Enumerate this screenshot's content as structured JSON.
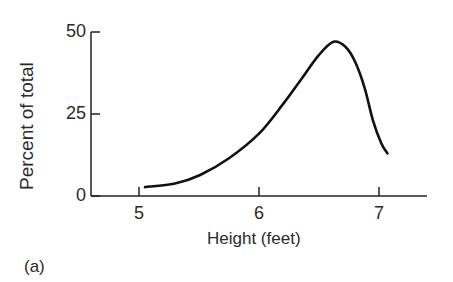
{
  "chart_data": {
    "type": "line",
    "title": "",
    "xlabel": "Height (feet)",
    "ylabel": "Percent of total",
    "panel_label": "(a)",
    "xlim": [
      4.6,
      7.4
    ],
    "ylim": [
      0,
      50
    ],
    "xticks": [
      5,
      6,
      7
    ],
    "yticks": [
      0,
      25,
      50
    ],
    "grid": false,
    "legend": null,
    "series": [
      {
        "name": "Height distribution",
        "color": "#111111",
        "x": [
          5.05,
          5.3,
          5.51,
          5.75,
          6.0,
          6.2,
          6.34,
          6.5,
          6.62,
          6.72,
          6.8,
          6.88,
          6.95,
          7.02,
          7.07
        ],
        "y": [
          2.7,
          3.8,
          6.4,
          11.5,
          19,
          28,
          35,
          43,
          47,
          45.5,
          41,
          33,
          23,
          16,
          13
        ]
      }
    ]
  }
}
